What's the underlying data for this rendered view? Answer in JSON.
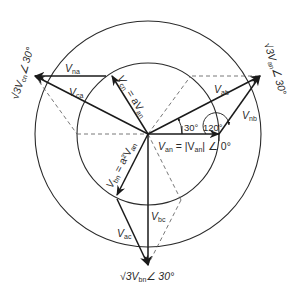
{
  "diagram": {
    "phasors": {
      "V_an": {
        "name": "V",
        "sub": "an",
        "angle_deg": 0,
        "magnitude": 1
      },
      "V_bn": {
        "name": "V",
        "sub": "bn",
        "angle_deg": -120,
        "magnitude": 1
      },
      "V_cn": {
        "name": "V",
        "sub": "cn",
        "angle_deg": 120,
        "magnitude": 1
      },
      "V_ab": {
        "name": "V",
        "sub": "ab",
        "angle_deg": 30,
        "magnitude": 1.732
      },
      "V_bc": {
        "name": "V",
        "sub": "bc",
        "angle_deg": -90,
        "magnitude": 1.732
      },
      "V_ca": {
        "name": "V",
        "sub": "ca",
        "angle_deg": 150,
        "magnitude": 1.732
      },
      "V_na": {
        "name": "V",
        "sub": "na"
      },
      "V_nb": {
        "name": "V",
        "sub": "nb"
      },
      "V_ac": {
        "name": "V",
        "sub": "ac"
      }
    },
    "labels": {
      "van_eq_1": "V",
      "van_eq_sub": "an",
      "van_eq_2": " = |V",
      "van_eq_sub2": "an",
      "van_eq_3": "| ∠ 0°",
      "vcn_eq_1": "V",
      "vcn_eq_sub": "cn",
      "vcn_eq_2": " = aV",
      "vcn_eq_sub2": "an",
      "vbn_eq_1": "V",
      "vbn_eq_sub": "bn",
      "vbn_eq_2": " = a²V",
      "vbn_eq_sub2": "an",
      "line_ab_1": "√3V",
      "line_ab_sub": "an",
      "line_ab_2": "∠ 30°",
      "line_ca_1": "√3V",
      "line_ca_sub": "cn",
      "line_ca_2": "∠ 30°",
      "line_bc_1": "√3V",
      "line_bc_sub": "bn",
      "line_bc_2": "∠ 30°",
      "angle_30": "30°",
      "angle_120": "120°"
    }
  }
}
